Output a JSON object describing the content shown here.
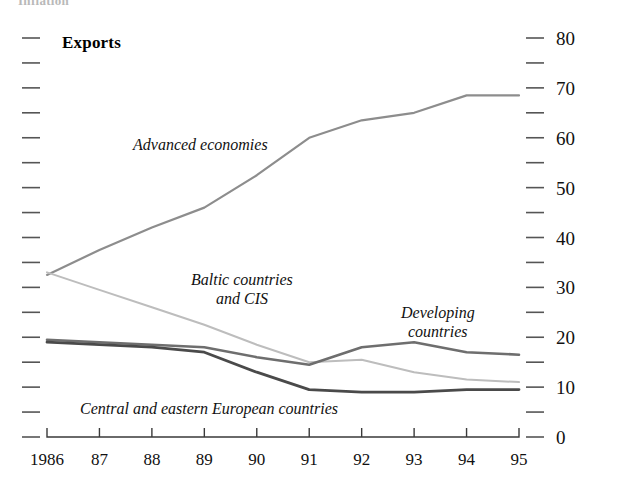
{
  "figure": {
    "clipped_header": "Inflation",
    "panel_title": "Exports"
  },
  "axes": {
    "y_right_labels": [
      "80",
      "70",
      "60",
      "50",
      "40",
      "30",
      "20",
      "10",
      "0"
    ],
    "x_labels": [
      "1986",
      "87",
      "88",
      "89",
      "90",
      "91",
      "92",
      "93",
      "94",
      "95"
    ]
  },
  "series_labels": {
    "advanced": "Advanced economies",
    "baltic_line1": "Baltic countries",
    "baltic_line2": "and CIS",
    "developing_line1": "Developing",
    "developing_line2": "countries",
    "central": "Central and eastern European countries"
  },
  "colors": {
    "advanced": "#8d8d8d",
    "baltic": "#bdbdbd",
    "developing": "#6e6e6e",
    "central": "#4a4a4a",
    "axis": "#3a3a3a",
    "background": "#ffffff"
  },
  "chart_data": {
    "type": "line",
    "title": "Exports",
    "xlabel": "",
    "ylabel": "",
    "x": [
      1986,
      1987,
      1988,
      1989,
      1990,
      1991,
      1992,
      1993,
      1994,
      1995
    ],
    "x_tick_labels": [
      "1986",
      "87",
      "88",
      "89",
      "90",
      "91",
      "92",
      "93",
      "94",
      "95"
    ],
    "ylim": [
      0,
      80
    ],
    "y_ticks_major": [
      0,
      10,
      20,
      30,
      40,
      50,
      60,
      70,
      80
    ],
    "y_ticks_minor": [
      5,
      15,
      25,
      35,
      45,
      55,
      65,
      75
    ],
    "y_axis_side": "right",
    "grid": false,
    "legend": "inline-annotations",
    "series": [
      {
        "name": "Advanced economies",
        "color": "#8d8d8d",
        "values": [
          32.5,
          37.5,
          42.0,
          46.0,
          52.5,
          60.0,
          63.5,
          65.0,
          68.5,
          68.5
        ]
      },
      {
        "name": "Baltic countries and CIS",
        "color": "#bdbdbd",
        "values": [
          33.0,
          29.5,
          26.0,
          22.5,
          18.5,
          15.0,
          15.5,
          13.0,
          11.5,
          11.0
        ]
      },
      {
        "name": "Developing countries",
        "color": "#6e6e6e",
        "values": [
          19.5,
          19.0,
          18.5,
          18.0,
          16.0,
          14.5,
          18.0,
          19.0,
          17.0,
          16.5
        ]
      },
      {
        "name": "Central and eastern European countries",
        "color": "#4a4a4a",
        "values": [
          19.0,
          18.5,
          18.0,
          17.0,
          13.0,
          9.5,
          9.0,
          9.0,
          9.5,
          9.5
        ]
      }
    ]
  }
}
